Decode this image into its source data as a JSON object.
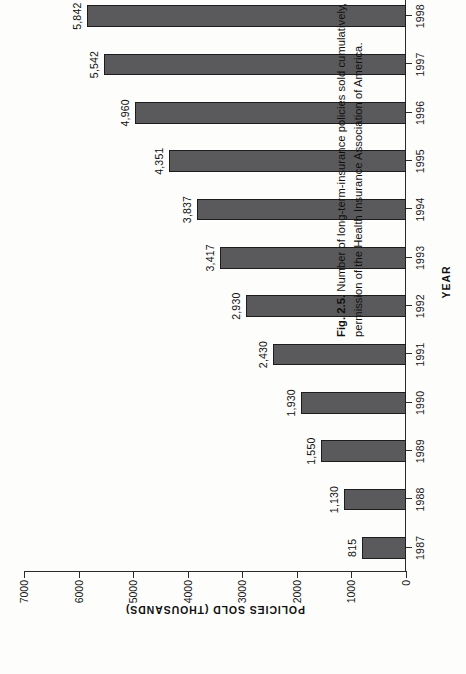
{
  "figure": {
    "caption_label": "Fig. 2.5.",
    "caption_line1": "Number of long-term-insurance policies sold cumulatively, 1987–98. Historical data from HIAA, 2000. Used with",
    "caption_line2": "permission of the Health Insurance Association of America."
  },
  "chart_data": {
    "type": "bar",
    "orientation": "vertical-rotated",
    "title": "",
    "xlabel": "YEAR",
    "ylabel": "POLICIES SOLD (THOUSANDS)",
    "categories": [
      "1987",
      "1988",
      "1989",
      "1990",
      "1991",
      "1992",
      "1993",
      "1994",
      "1995",
      "1996",
      "1997",
      "1998"
    ],
    "values": [
      815,
      1130,
      1550,
      1930,
      2430,
      2930,
      3417,
      3837,
      4351,
      4960,
      5542,
      5842
    ],
    "value_labels": [
      "815",
      "1,130",
      "1,550",
      "1,930",
      "2,430",
      "2,930",
      "3,417",
      "3,837",
      "4,351",
      "4,960",
      "5,542",
      "5,842"
    ],
    "ylim": [
      0,
      7000
    ],
    "yticks": [
      0,
      1000,
      2000,
      3000,
      4000,
      5000,
      6000,
      7000
    ],
    "ytick_labels": [
      "0",
      "1000",
      "2000",
      "3000",
      "4000",
      "5000",
      "6000",
      "7000"
    ],
    "grid": false,
    "legend": null,
    "bar_color": "#5a5a5c",
    "bar_edge_color": "#1d1d1d",
    "axis_color": "#2b2b2b"
  }
}
